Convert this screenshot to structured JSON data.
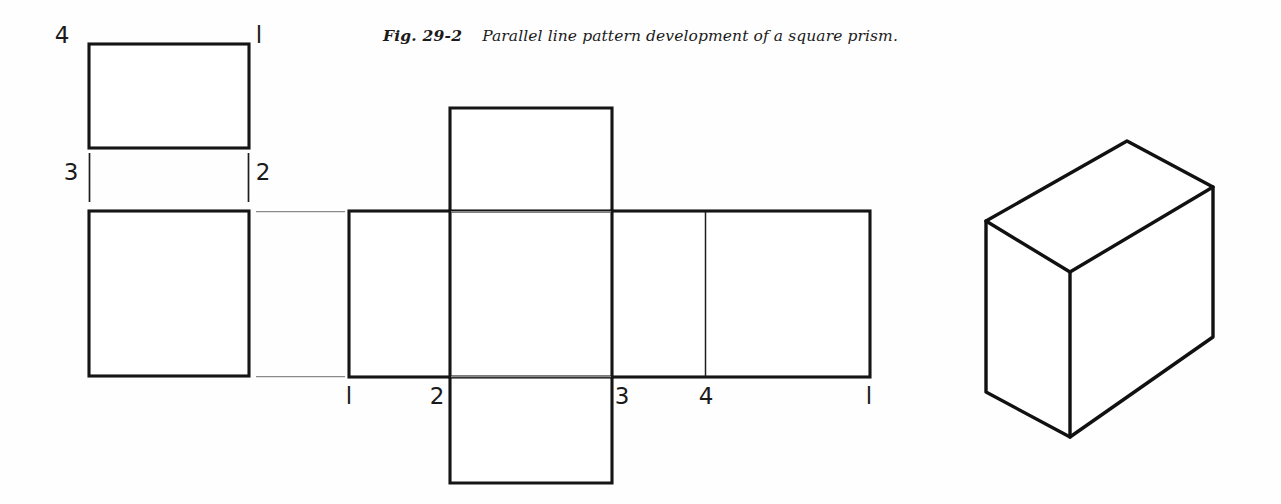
{
  "figure": {
    "label": "Fig. 29-2",
    "caption": "Parallel line pattern development of a square prism.",
    "colors": {
      "object_line": "#151515",
      "fold_line": "#1d1d1d",
      "projection_line": "#8a8a8a",
      "background": "#fefefe"
    }
  },
  "top_view": {
    "name": "top view",
    "labels": {
      "corner_4": "4",
      "corner_1": "l",
      "corner_3": "3",
      "corner_2": "2"
    }
  },
  "front_view": {
    "name": "front view"
  },
  "development": {
    "name": "parallel line development",
    "bottom_labels": {
      "point_1_left": "l",
      "point_2": "2",
      "point_3": "3",
      "point_4": "4",
      "point_1_right": "l"
    }
  },
  "pictorial": {
    "name": "isometric pictorial of square prism"
  }
}
